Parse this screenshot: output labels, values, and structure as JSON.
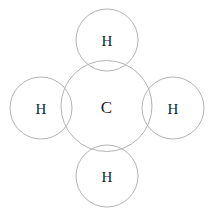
{
  "diagram": {
    "type": "molecule-venn-circles",
    "canvas": {
      "width": 214,
      "height": 212,
      "background": "#ffffff"
    },
    "stroke_color": "#b3b3b3",
    "label_color": "#1c1c1c",
    "atoms": [
      {
        "id": "carbon-center",
        "symbol": "C",
        "role": "central-atom",
        "cx": 106.5,
        "cy": 106,
        "r": 45.5,
        "label_x": 106.5,
        "label_y": 107
      },
      {
        "id": "hydrogen-top",
        "symbol": "H",
        "role": "substituent-atom",
        "cx": 107,
        "cy": 40,
        "r": 31,
        "label_x": 107,
        "label_y": 41
      },
      {
        "id": "hydrogen-left",
        "symbol": "H",
        "role": "substituent-atom",
        "cx": 41,
        "cy": 108,
        "r": 31,
        "label_x": 41,
        "label_y": 109
      },
      {
        "id": "hydrogen-right",
        "symbol": "H",
        "role": "substituent-atom",
        "cx": 173,
        "cy": 108,
        "r": 31,
        "label_x": 173,
        "label_y": 109
      },
      {
        "id": "hydrogen-bottom",
        "symbol": "H",
        "role": "substituent-atom",
        "cx": 107,
        "cy": 176,
        "r": 31,
        "label_x": 107,
        "label_y": 177
      }
    ]
  }
}
